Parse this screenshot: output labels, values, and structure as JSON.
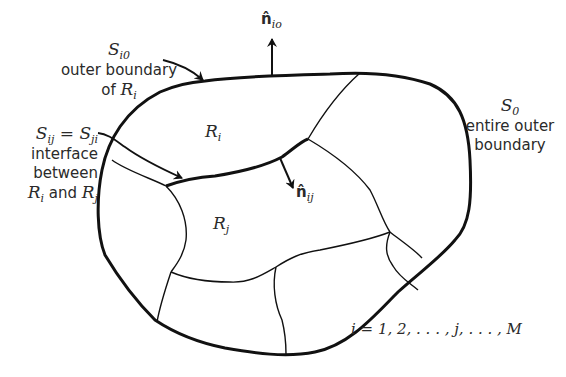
{
  "figure": {
    "type": "region decomposition diagram",
    "regions": {
      "ri": {
        "symbol": "R",
        "sub": "i"
      },
      "rj": {
        "symbol": "R",
        "sub": "j"
      }
    },
    "labels": {
      "si0": {
        "symbol": "S",
        "sub": "i0",
        "line1": "outer boundary",
        "line2_prefix": "of ",
        "line2_symbol": "R",
        "line2_sub": "i"
      },
      "sij": {
        "lhs_symbol": "S",
        "lhs_sub": "ij",
        "eq": " = ",
        "rhs_symbol": "S",
        "rhs_sub": "ji",
        "line1": "interface",
        "line2": "between",
        "line3_sym1": "R",
        "line3_sub1": "i",
        "line3_mid": " and ",
        "line3_sym2": "R",
        "line3_sub2": "j"
      },
      "s0": {
        "symbol": "S",
        "sub": "0",
        "line1": "entire outer",
        "line2": "boundary"
      },
      "nio": {
        "symbol": "n̂",
        "sub": "io"
      },
      "nij": {
        "symbol": "n̂",
        "sub": "ij"
      },
      "index": {
        "text": "i = 1, 2, . . . , j, . . . , M"
      }
    },
    "colors": {
      "stroke": "#111111",
      "text": "#2a2a2a",
      "background": "#ffffff"
    }
  }
}
